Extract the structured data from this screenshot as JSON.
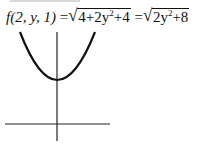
{
  "equation": {
    "lhs": "f(2, y, 1)",
    "eq1": "=",
    "rad1_a": "4+2y",
    "rad1_exp": "2",
    "rad1_b": "+4",
    "eq2": "=",
    "rad2_a": "2y",
    "rad2_exp": "2",
    "rad2_b": "+8",
    "full_text": "f(2, y, 1) = √(4+2y²+4) = √(2y²+8)"
  },
  "graph": {
    "description": "Upward-opening parabola z = sqrt(2y^2 + 8) with vertical and horizontal axes",
    "stroke_color": "#111111",
    "vertex": {
      "x": 57,
      "y": 80
    },
    "left_top": {
      "x": 20,
      "y": 32
    },
    "right_top": {
      "x": 95,
      "y": 32
    },
    "h_axis": {
      "x1": 5,
      "x2": 110,
      "y": 124
    },
    "v_axis": {
      "x": 57,
      "y1": 32,
      "y2": 141
    }
  }
}
